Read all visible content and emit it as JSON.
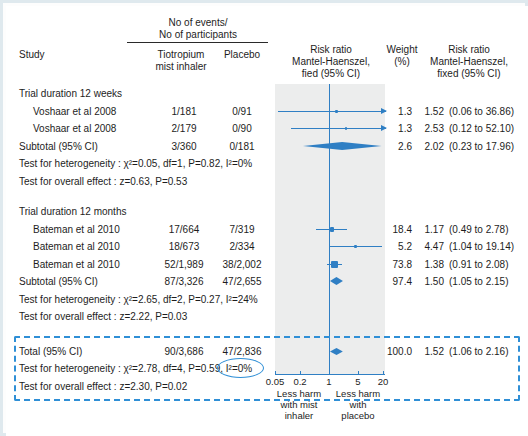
{
  "figure": {
    "columns": {
      "study": "Study",
      "events_group_title_line1": "No of events/",
      "events_group_title_line2": "No of participants",
      "treatment_line1": "Tiotropium",
      "treatment_line2": "mist inhaler",
      "control": "Placebo",
      "plot_header_line1": "Risk ratio",
      "plot_header_line2": "Mantel-Haenszel,",
      "plot_header_line3": "fied  (95% CI)",
      "weight_line1": "Weight",
      "weight_line2": "(%)",
      "effect_header_line1": "Risk ratio",
      "effect_header_line2": "Mantel-Haenszel,",
      "effect_header_line3": "fixed  (95% CI)"
    },
    "groups": [
      {
        "heading": "Trial duration 12 weeks",
        "rows": [
          {
            "study": "Voshaar et al 2008",
            "treatment": "1/181",
            "control": "0/91",
            "weight": "1.3",
            "effect": "1.52",
            "ci": "(0.06 to 36.86)",
            "rr": 1.52,
            "lcl": 0.06,
            "ucl": 36.86,
            "type": "study"
          },
          {
            "study": "Voshaar et al 2008",
            "treatment": "2/179",
            "control": "0/90",
            "weight": "1.3",
            "effect": "2.53",
            "ci": "(0.12 to 52.10)",
            "rr": 2.53,
            "lcl": 0.12,
            "ucl": 52.1,
            "type": "study"
          },
          {
            "study": "Subtotal  (95% CI)",
            "treatment": "3/360",
            "control": "0/181",
            "weight": "2.6",
            "effect": "2.02",
            "ci": "(0.23 to 17.96)",
            "rr": 2.02,
            "lcl": 0.23,
            "ucl": 17.96,
            "type": "subtotal"
          }
        ],
        "heterogeneity": "Test for heterogeneity :  χ²=0.05, df=1, P=0.82, I²=0%",
        "overall_effect": "Test for overall effect : z=0.63, P=0.53"
      },
      {
        "heading": "Trial duration 12 months",
        "rows": [
          {
            "study": "Bateman et al 2010",
            "treatment": "17/664",
            "control": "7/319",
            "weight": "18.4",
            "effect": "1.17",
            "ci": "(0.49 to 2.78)",
            "rr": 1.17,
            "lcl": 0.49,
            "ucl": 2.78,
            "type": "study"
          },
          {
            "study": "Bateman et al 2010",
            "treatment": "18/673",
            "control": "2/334",
            "weight": "5.2",
            "effect": "4.47",
            "ci": "(1.04 to 19.14)",
            "rr": 4.47,
            "lcl": 1.04,
            "ucl": 19.14,
            "type": "study"
          },
          {
            "study": "Bateman et al 2010",
            "treatment": "52/1,989",
            "control": "38/2,002",
            "weight": "73.8",
            "effect": "1.38",
            "ci": "(0.91 to 2.08)",
            "rr": 1.38,
            "lcl": 0.91,
            "ucl": 2.08,
            "type": "study"
          },
          {
            "study": "Subtotal  (95% CI)",
            "treatment": "87/3,326",
            "control": "47/2,655",
            "weight": "97.4",
            "effect": "1.50",
            "ci": "(1.05 to 2.15)",
            "rr": 1.5,
            "lcl": 1.05,
            "ucl": 2.15,
            "type": "subtotal"
          }
        ],
        "heterogeneity": "Test for heterogeneity :  χ²=2.65, df=2, P=0.27, I²=24%",
        "overall_effect": "Test for overall effect : z=2.22, P=0.03"
      }
    ],
    "total": {
      "row": {
        "study": "Total  (95% CI)",
        "treatment": "90/3,686",
        "control": "47/2,836",
        "weight": "100.0",
        "effect": "1.52",
        "ci": "(1.06 to 2.16)",
        "rr": 1.52,
        "lcl": 1.06,
        "ucl": 2.16,
        "type": "total"
      },
      "heterogeneity_prefix": "Test for heterogeneity :  χ²=2.78, df=4, P=0.59,",
      "heterogeneity_highlight": "I²=0%",
      "overall_effect": "Test for overall effect : z=2.30, P=0.02"
    },
    "axis": {
      "ticks": [
        "0.05",
        "0.2",
        "1",
        "5",
        "20"
      ],
      "tick_values": [
        0.05,
        0.2,
        1,
        5,
        20
      ],
      "min": 0.05,
      "max": 20,
      "null_value": 1,
      "left_label_line1": "Less harm",
      "left_label_line2": "with mist",
      "left_label_line3": "inhaler",
      "right_label_line1": "Less harm",
      "right_label_line2": "with",
      "right_label_line3": "placebo"
    },
    "colors": {
      "accent": "#2f7fc4",
      "annotation": "#2f8fd6",
      "band": "#eceded",
      "frame": "#dfe9ee",
      "text": "#1d1d1d"
    }
  },
  "chart_data": {
    "type": "forest",
    "xlabel": "Risk ratio",
    "xscale": "log",
    "xlim": [
      0.05,
      20
    ],
    "null_line": 1,
    "xticks": [
      0.05,
      0.2,
      1,
      5,
      20
    ],
    "studies": [
      {
        "label": "Voshaar et al 2008",
        "rr": 1.52,
        "lcl": 0.06,
        "ucl": 36.86,
        "weight": 1.3,
        "events_treatment": "1/181",
        "events_control": "0/91",
        "group": "Trial duration 12 weeks"
      },
      {
        "label": "Voshaar et al 2008",
        "rr": 2.53,
        "lcl": 0.12,
        "ucl": 52.1,
        "weight": 1.3,
        "events_treatment": "2/179",
        "events_control": "0/90",
        "group": "Trial duration 12 weeks"
      },
      {
        "label": "Subtotal (95% CI)",
        "rr": 2.02,
        "lcl": 0.23,
        "ucl": 17.96,
        "weight": 2.6,
        "events_treatment": "3/360",
        "events_control": "0/181",
        "group": "Trial duration 12 weeks"
      },
      {
        "label": "Bateman et al 2010",
        "rr": 1.17,
        "lcl": 0.49,
        "ucl": 2.78,
        "weight": 18.4,
        "events_treatment": "17/664",
        "events_control": "7/319",
        "group": "Trial duration 12 months"
      },
      {
        "label": "Bateman et al 2010",
        "rr": 4.47,
        "lcl": 1.04,
        "ucl": 19.14,
        "weight": 5.2,
        "events_treatment": "18/673",
        "events_control": "2/334",
        "group": "Trial duration 12 months"
      },
      {
        "label": "Bateman et al 2010",
        "rr": 1.38,
        "lcl": 0.91,
        "ucl": 2.08,
        "weight": 73.8,
        "events_treatment": "52/1,989",
        "events_control": "38/2,002",
        "group": "Trial duration 12 months"
      },
      {
        "label": "Subtotal (95% CI)",
        "rr": 1.5,
        "lcl": 1.05,
        "ucl": 2.15,
        "weight": 97.4,
        "events_treatment": "87/3,326",
        "events_control": "47/2,655",
        "group": "Trial duration 12 months"
      },
      {
        "label": "Total (95% CI)",
        "rr": 1.52,
        "lcl": 1.06,
        "ucl": 2.16,
        "weight": 100.0,
        "events_treatment": "90/3,686",
        "events_control": "47/2,836",
        "group": "Total"
      }
    ],
    "left_annotation": "Less harm with mist inhaler",
    "right_annotation": "Less harm with placebo"
  }
}
